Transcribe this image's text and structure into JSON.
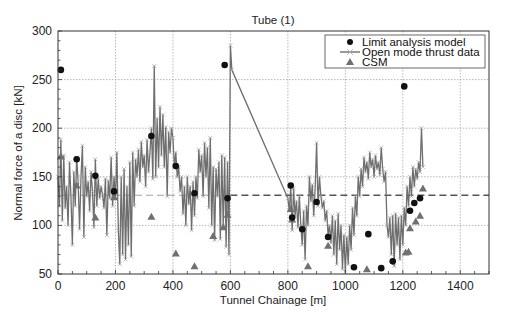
{
  "chart_data": {
    "type": "line",
    "title": "Tube (1)",
    "xlabel": "Tunnel Chainage [m]",
    "ylabel": "Normal force of a disc [kN]",
    "xlim": [
      0,
      1500
    ],
    "ylim": [
      50,
      300
    ],
    "xticks": [
      0,
      200,
      400,
      600,
      800,
      1000,
      1200,
      1400
    ],
    "yticks": [
      50,
      100,
      150,
      200,
      250,
      300
    ],
    "grid": true,
    "legend_position": "upper right",
    "legend": [
      "Limit analysis model",
      "Open mode thrust data",
      "CSM"
    ],
    "reference_line": {
      "label": "mean thrust (dashed)",
      "y": 131
    },
    "series": [
      {
        "name": "Limit analysis model",
        "marker": "circle",
        "color": "#111111",
        "points": [
          [
            10,
            260
          ],
          [
            65,
            168
          ],
          [
            130,
            151
          ],
          [
            195,
            135
          ],
          [
            325,
            192
          ],
          [
            410,
            161
          ],
          [
            475,
            133
          ],
          [
            580,
            265
          ],
          [
            590,
            128
          ],
          [
            810,
            141
          ],
          [
            815,
            108
          ],
          [
            850,
            96
          ],
          [
            900,
            124
          ],
          [
            940,
            88
          ],
          [
            1030,
            57
          ],
          [
            1080,
            91
          ],
          [
            1125,
            56
          ],
          [
            1165,
            63
          ],
          [
            1205,
            243
          ],
          [
            1225,
            115
          ],
          [
            1240,
            123
          ],
          [
            1260,
            128
          ]
        ]
      },
      {
        "name": "CSM",
        "marker": "triangle",
        "color": "#707070",
        "points": [
          [
            10,
            171
          ],
          [
            65,
            141
          ],
          [
            130,
            108
          ],
          [
            195,
            129
          ],
          [
            325,
            109
          ],
          [
            410,
            71
          ],
          [
            475,
            58
          ],
          [
            540,
            89
          ],
          [
            575,
            98
          ],
          [
            590,
            111
          ],
          [
            810,
            117
          ],
          [
            815,
            106
          ],
          [
            870,
            58
          ],
          [
            940,
            79
          ],
          [
            1075,
            55
          ],
          [
            1210,
            72
          ],
          [
            1220,
            73
          ],
          [
            1225,
            97
          ],
          [
            1245,
            104
          ],
          [
            1260,
            110
          ],
          [
            1270,
            138
          ]
        ]
      },
      {
        "name": "Open mode thrust data",
        "marker": "x-line",
        "color": "#6e6e6e",
        "points": [
          [
            0,
            150
          ],
          [
            5,
            120
          ],
          [
            10,
            188
          ],
          [
            15,
            105
          ],
          [
            20,
            172
          ],
          [
            25,
            118
          ],
          [
            30,
            140
          ],
          [
            35,
            100
          ],
          [
            40,
            165
          ],
          [
            45,
            130
          ],
          [
            50,
            80
          ],
          [
            55,
            155
          ],
          [
            60,
            120
          ],
          [
            65,
            170
          ],
          [
            70,
            145
          ],
          [
            75,
            96
          ],
          [
            80,
            150
          ],
          [
            85,
            182
          ],
          [
            90,
            88
          ],
          [
            95,
            160
          ],
          [
            100,
            130
          ],
          [
            105,
            145
          ],
          [
            110,
            115
          ],
          [
            115,
            155
          ],
          [
            120,
            135
          ],
          [
            125,
            98
          ],
          [
            130,
            168
          ],
          [
            135,
            120
          ],
          [
            140,
            148
          ],
          [
            145,
            128
          ],
          [
            150,
            140
          ],
          [
            155,
            132
          ],
          [
            160,
            118
          ],
          [
            165,
            148
          ],
          [
            170,
            90
          ],
          [
            175,
            146
          ],
          [
            180,
            128
          ],
          [
            185,
            170
          ],
          [
            190,
            120
          ],
          [
            195,
            150
          ],
          [
            200,
            128
          ],
          [
            205,
            175
          ],
          [
            210,
            95
          ],
          [
            215,
            60
          ],
          [
            220,
            150
          ],
          [
            225,
            70
          ],
          [
            230,
            158
          ],
          [
            235,
            65
          ],
          [
            240,
            140
          ],
          [
            245,
            80
          ],
          [
            250,
            165
          ],
          [
            255,
            68
          ],
          [
            260,
            175
          ],
          [
            265,
            120
          ],
          [
            270,
            168
          ],
          [
            275,
            150
          ],
          [
            280,
            178
          ],
          [
            285,
            145
          ],
          [
            290,
            186
          ],
          [
            295,
            160
          ],
          [
            300,
            172
          ],
          [
            305,
            140
          ],
          [
            310,
            188
          ],
          [
            315,
            155
          ],
          [
            320,
            175
          ],
          [
            325,
            200
          ],
          [
            330,
            148
          ],
          [
            335,
            264
          ],
          [
            340,
            150
          ],
          [
            345,
            210
          ],
          [
            350,
            160
          ],
          [
            355,
            222
          ],
          [
            360,
            172
          ],
          [
            365,
            214
          ],
          [
            370,
            160
          ],
          [
            375,
            201
          ],
          [
            380,
            130
          ],
          [
            385,
            196
          ],
          [
            390,
            175
          ],
          [
            395,
            200
          ],
          [
            400,
            190
          ],
          [
            405,
            160
          ],
          [
            410,
            175
          ],
          [
            415,
            150
          ],
          [
            420,
            160
          ],
          [
            425,
            135
          ],
          [
            430,
            150
          ],
          [
            435,
            112
          ],
          [
            440,
            140
          ],
          [
            445,
            100
          ],
          [
            450,
            150
          ],
          [
            455,
            122
          ],
          [
            460,
            140
          ],
          [
            465,
            95
          ],
          [
            470,
            145
          ],
          [
            475,
            110
          ],
          [
            480,
            150
          ],
          [
            485,
            128
          ],
          [
            490,
            178
          ],
          [
            495,
            155
          ],
          [
            500,
            172
          ],
          [
            505,
            130
          ],
          [
            510,
            185
          ],
          [
            515,
            150
          ],
          [
            520,
            180
          ],
          [
            525,
            118
          ],
          [
            530,
            190
          ],
          [
            535,
            100
          ],
          [
            540,
            160
          ],
          [
            545,
            85
          ],
          [
            550,
            158
          ],
          [
            555,
            130
          ],
          [
            560,
            165
          ],
          [
            565,
            86
          ],
          [
            570,
            172
          ],
          [
            575,
            100
          ],
          [
            580,
            170
          ],
          [
            585,
            78
          ],
          [
            590,
            165
          ],
          [
            595,
            70
          ],
          [
            600,
            285
          ],
          [
            605,
            260
          ],
          [
            800,
            128
          ],
          [
            805,
            115
          ],
          [
            810,
            140
          ],
          [
            815,
            95
          ],
          [
            820,
            138
          ],
          [
            825,
            110
          ],
          [
            830,
            125
          ],
          [
            835,
            98
          ],
          [
            840,
            130
          ],
          [
            845,
            100
          ],
          [
            850,
            80
          ],
          [
            855,
            115
          ],
          [
            860,
            65
          ],
          [
            865,
            120
          ],
          [
            870,
            100
          ],
          [
            875,
            150
          ],
          [
            880,
            125
          ],
          [
            885,
            142
          ],
          [
            890,
            110
          ],
          [
            895,
            138
          ],
          [
            900,
            185
          ],
          [
            905,
            120
          ],
          [
            910,
            150
          ],
          [
            915,
            130
          ],
          [
            920,
            118
          ],
          [
            925,
            125
          ],
          [
            930,
            105
          ],
          [
            935,
            115
          ],
          [
            940,
            90
          ],
          [
            945,
            100
          ],
          [
            950,
            82
          ],
          [
            955,
            110
          ],
          [
            960,
            70
          ],
          [
            965,
            105
          ],
          [
            970,
            60
          ],
          [
            975,
            112
          ],
          [
            980,
            75
          ],
          [
            985,
            100
          ],
          [
            990,
            55
          ],
          [
            995,
            90
          ],
          [
            1000,
            52
          ],
          [
            1005,
            88
          ],
          [
            1010,
            60
          ],
          [
            1015,
            100
          ],
          [
            1020,
            75
          ],
          [
            1025,
            118
          ],
          [
            1030,
            90
          ],
          [
            1035,
            130
          ],
          [
            1040,
            110
          ],
          [
            1045,
            150
          ],
          [
            1050,
            130
          ],
          [
            1055,
            158
          ],
          [
            1060,
            140
          ],
          [
            1065,
            170
          ],
          [
            1070,
            155
          ],
          [
            1075,
            165
          ],
          [
            1080,
            148
          ],
          [
            1085,
            175
          ],
          [
            1090,
            160
          ],
          [
            1095,
            168
          ],
          [
            1100,
            150
          ],
          [
            1105,
            172
          ],
          [
            1110,
            158
          ],
          [
            1115,
            165
          ],
          [
            1120,
            152
          ],
          [
            1125,
            180
          ],
          [
            1130,
            158
          ],
          [
            1135,
            145
          ],
          [
            1140,
            155
          ],
          [
            1145,
            100
          ],
          [
            1150,
            88
          ],
          [
            1155,
            108
          ],
          [
            1160,
            70
          ],
          [
            1165,
            110
          ],
          [
            1170,
            58
          ],
          [
            1175,
            112
          ],
          [
            1180,
            80
          ],
          [
            1185,
            108
          ],
          [
            1190,
            65
          ],
          [
            1195,
            110
          ],
          [
            1200,
            80
          ],
          [
            1205,
            118
          ],
          [
            1210,
            100
          ],
          [
            1215,
            140
          ],
          [
            1220,
            120
          ],
          [
            1225,
            150
          ],
          [
            1230,
            130
          ],
          [
            1235,
            160
          ],
          [
            1240,
            140
          ],
          [
            1245,
            158
          ],
          [
            1250,
            148
          ],
          [
            1255,
            165
          ],
          [
            1260,
            155
          ],
          [
            1265,
            200
          ],
          [
            1270,
            160
          ]
        ]
      }
    ]
  },
  "labels": {
    "title": "Tube (1)",
    "xlabel": "Tunnel Chainage [m]",
    "ylabel": "Normal force of a disc [kN]",
    "legend": [
      "Limit analysis model",
      "Open mode thrust data",
      "CSM"
    ]
  },
  "colors": {
    "axis": "#333333",
    "grid": "#9a9a9a",
    "thrust": "#6e6e6e",
    "limit": "#111111",
    "csm": "#707070",
    "mean_line": "#555555"
  }
}
